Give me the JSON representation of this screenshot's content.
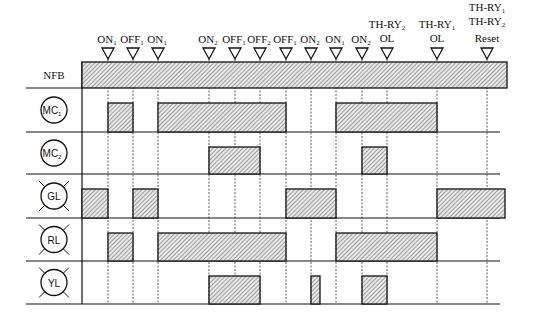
{
  "diagram": {
    "type": "timing-diagram",
    "events": [
      {
        "label": "ON",
        "sub": "1",
        "x": 108
      },
      {
        "label": "OFF",
        "sub": "1",
        "x": 133
      },
      {
        "label": "ON",
        "sub": "1",
        "x": 158
      },
      {
        "label": "ON",
        "sub": "2",
        "x": 209
      },
      {
        "label": "OFF",
        "sub": "1",
        "x": 235
      },
      {
        "label": "OFF",
        "sub": "2",
        "x": 260
      },
      {
        "label": "OFF",
        "sub": "1",
        "x": 286
      },
      {
        "label": "ON",
        "sub": "2",
        "x": 311
      },
      {
        "label": "ON",
        "sub": "1",
        "x": 336
      },
      {
        "label": "ON",
        "sub": "2",
        "x": 362
      },
      {
        "label": "TH-RY",
        "sub": "2",
        "line2": "OL",
        "x": 387
      },
      {
        "label": "TH-RY",
        "sub": "1",
        "line2": "OL",
        "x": 437
      },
      {
        "label": "TH-RY",
        "sub": "1",
        "line2": "TH-RY",
        "sub2": "2",
        "line3": "Reset",
        "x": 487
      }
    ],
    "rows": [
      {
        "name": "NFB",
        "symbol": "plain",
        "segments": [
          [
            82,
            507
          ]
        ]
      },
      {
        "name": "MC",
        "sub": "1",
        "symbol": "coil",
        "segments": [
          [
            108,
            133
          ],
          [
            158,
            286
          ],
          [
            336,
            437
          ]
        ]
      },
      {
        "name": "MC",
        "sub": "2",
        "symbol": "coil",
        "segments": [
          [
            209,
            260
          ],
          [
            362,
            387
          ]
        ]
      },
      {
        "name": "GL",
        "symbol": "lamp",
        "segments": [
          [
            82,
            108
          ],
          [
            133,
            158
          ],
          [
            286,
            336
          ],
          [
            437,
            505
          ]
        ]
      },
      {
        "name": "RL",
        "symbol": "lamp",
        "segments": [
          [
            108,
            133
          ],
          [
            158,
            286
          ],
          [
            336,
            437
          ]
        ]
      },
      {
        "name": "YL",
        "symbol": "lamp",
        "segments": [
          [
            209,
            260
          ],
          [
            311,
            320
          ],
          [
            362,
            387
          ]
        ]
      }
    ]
  }
}
